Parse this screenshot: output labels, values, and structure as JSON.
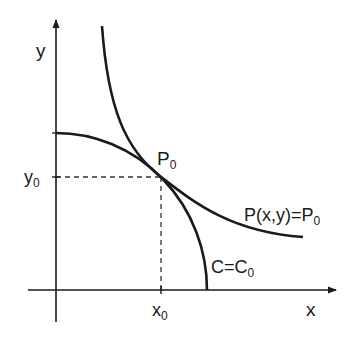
{
  "diagram": {
    "type": "tangency-diagram",
    "axes": {
      "x_label": "x",
      "y_label": "y"
    },
    "point": {
      "label": "P",
      "subscript": "0",
      "x_tick": {
        "base": "x",
        "subscript": "0"
      },
      "y_tick": {
        "base": "y",
        "subscript": "0"
      }
    },
    "curves": [
      {
        "id": "isoquant",
        "shape": "convex (hyperbola-like)",
        "label_main": "P(x,y)=P",
        "label_sub": "0"
      },
      {
        "id": "cost-curve",
        "shape": "concave (quarter-ellipse)",
        "label_main": "C=C",
        "label_sub": "0"
      }
    ],
    "colors": {
      "stroke": "#1a1a1a",
      "dashed": "#333333",
      "background": "#ffffff"
    }
  }
}
